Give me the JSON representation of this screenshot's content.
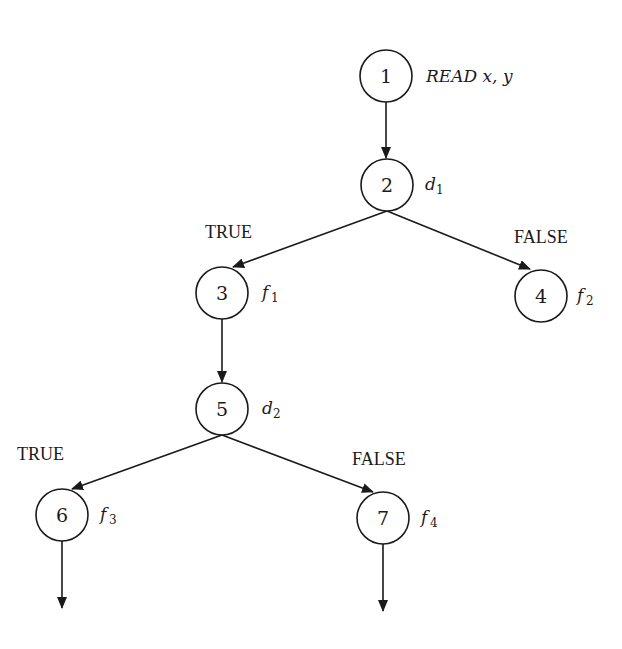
{
  "diagram": {
    "type": "control-flow-graph",
    "nodes": [
      {
        "id": "1",
        "label": "1",
        "x": 386,
        "y": 76,
        "annotation": "READ x, y",
        "annotation_main": "READ x, y",
        "annotation_sub": ""
      },
      {
        "id": "2",
        "label": "2",
        "x": 387,
        "y": 185,
        "annotation": "d1",
        "annotation_main": "d",
        "annotation_sub": "1"
      },
      {
        "id": "3",
        "label": "3",
        "x": 222,
        "y": 293,
        "annotation": "f1",
        "annotation_main": "f",
        "annotation_sub": "1"
      },
      {
        "id": "4",
        "label": "4",
        "x": 541,
        "y": 296,
        "annotation": "f2",
        "annotation_main": "f",
        "annotation_sub": "2"
      },
      {
        "id": "5",
        "label": "5",
        "x": 222,
        "y": 409,
        "annotation": "d2",
        "annotation_main": "d",
        "annotation_sub": "2"
      },
      {
        "id": "6",
        "label": "6",
        "x": 62,
        "y": 515,
        "annotation": "f3",
        "annotation_main": "f",
        "annotation_sub": "3"
      },
      {
        "id": "7",
        "label": "7",
        "x": 383,
        "y": 518,
        "annotation": "f4",
        "annotation_main": "f",
        "annotation_sub": "4"
      }
    ],
    "edges": [
      {
        "from": "1",
        "to": "2",
        "label": ""
      },
      {
        "from": "2",
        "to": "3",
        "label": "TRUE"
      },
      {
        "from": "2",
        "to": "4",
        "label": "FALSE"
      },
      {
        "from": "3",
        "to": "5",
        "label": ""
      },
      {
        "from": "5",
        "to": "6",
        "label": "TRUE"
      },
      {
        "from": "5",
        "to": "7",
        "label": "FALSE"
      },
      {
        "from": "6",
        "to": "continue",
        "label": ""
      },
      {
        "from": "7",
        "to": "continue",
        "label": ""
      }
    ],
    "branch_labels": {
      "d1_true": "TRUE",
      "d1_false": "FALSE",
      "d2_true": "TRUE",
      "d2_false": "FALSE"
    }
  }
}
